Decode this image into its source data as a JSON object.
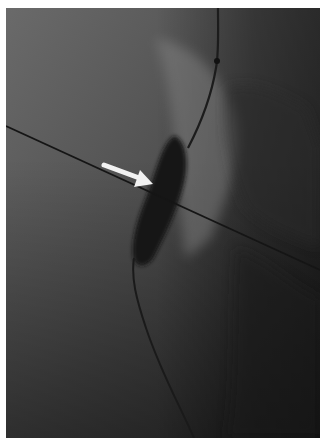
{
  "image": {
    "description": "Grayscale fluoroscopy image showing a guidewire with a dark balloon-shaped contrast-filled segment; a white arrow points to the balloon waist; a thin dark line crosses diagonally.",
    "arrow_color": "#f2f2f2",
    "background_tone": "#555555",
    "balloon_tone": "#151515"
  },
  "caption": {
    "text": ""
  }
}
